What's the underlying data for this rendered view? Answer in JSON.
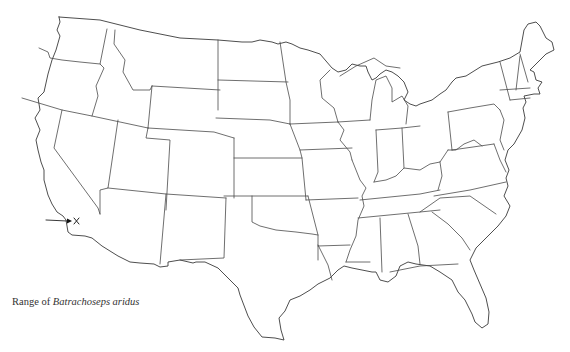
{
  "figure": {
    "caption_prefix": "Range of",
    "caption_species": "Batrachoseps aridus",
    "region": "Contiguous United States (state boundaries)",
    "line_color": "#4a4a4a",
    "background": "#ffffff"
  },
  "range_marker": {
    "symbol": "×",
    "symbol_position_px": [
      75,
      221
    ],
    "arrow_from_px": [
      46,
      220
    ],
    "arrow_to_px": [
      70,
      221
    ],
    "location_description": "Southern California (inland, east of Los Angeles area)"
  }
}
